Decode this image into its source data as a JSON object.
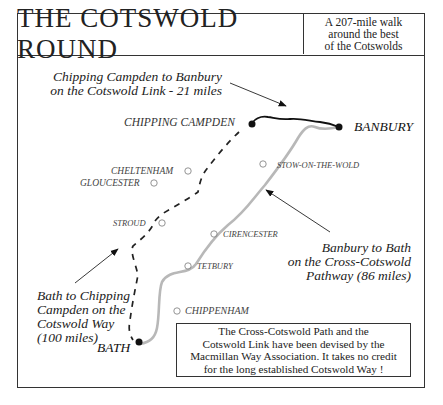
{
  "header": {
    "title": "THE COTSWOLD ROUND",
    "subtitle_lines": [
      "A 207-mile walk",
      "around the best",
      "of the Cotswolds"
    ]
  },
  "routes": {
    "cotswold_link": {
      "label_lines": [
        "Chipping Campden to Banbury",
        "on the Cotswold Link - 21 miles"
      ],
      "style": "solid-black",
      "miles": 21
    },
    "cross_cotswold": {
      "label_lines": [
        "Banbury to Bath",
        "on the Cross-Cotswold",
        "Pathway (86 miles)"
      ],
      "style": "solid-grey",
      "miles": 86
    },
    "cotswold_way": {
      "label_lines": [
        "Bath to Chipping",
        "Campden on the",
        "Cotswold Way",
        "(100 miles)"
      ],
      "style": "dashed-black",
      "miles": 100
    }
  },
  "endpoints": {
    "chipping_campden": "CHIPPING CAMPDEN",
    "banbury": "BANBURY",
    "bath": "BATH"
  },
  "towns": {
    "cheltenham": "CHELTENHAM",
    "gloucester": "GLOUCESTER",
    "stow": "STOW-ON-THE-WOLD",
    "stroud": "STROUD",
    "cirencester": "CIRENCESTER",
    "tetbury": "TETBURY",
    "chippenham": "CHIPPENHAM"
  },
  "info_box": {
    "lines": [
      "The Cross-Cotswold Path and the",
      "Cotswold Link have been devised by the",
      "Macmillan Way Association. It takes no credit",
      "for the long established Cotswold Way !"
    ]
  },
  "colors": {
    "border": "#333333",
    "cotswold_link": "#111111",
    "cross_cotswold": "#b5b5b5",
    "cotswold_way": "#222222",
    "town_marker": "#888888"
  }
}
